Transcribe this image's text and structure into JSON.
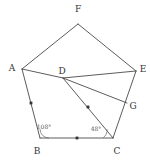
{
  "figure": {
    "type": "geometry-diagram",
    "background_color": "#ffffff",
    "line_color": "#4a4a4a",
    "label_color": "#333333",
    "canvas": {
      "width": 150,
      "height": 162
    }
  },
  "points": [
    {
      "id": "A",
      "label": "A",
      "x": 22,
      "y": 69,
      "label_x": 12,
      "label_y": 68
    },
    {
      "id": "B",
      "label": "B",
      "x": 40,
      "y": 138,
      "label_x": 37,
      "label_y": 151
    },
    {
      "id": "C",
      "label": "C",
      "x": 113,
      "y": 138,
      "label_x": 117,
      "label_y": 151
    },
    {
      "id": "D",
      "label": "D",
      "x": 63,
      "y": 78,
      "label_x": 62,
      "label_y": 71
    },
    {
      "id": "E",
      "label": "E",
      "x": 136,
      "y": 71,
      "label_x": 143,
      "label_y": 69
    },
    {
      "id": "F",
      "label": "F",
      "x": 78,
      "y": 24,
      "label_x": 78,
      "label_y": 9
    },
    {
      "id": "G",
      "label": "G",
      "x": 127,
      "y": 103,
      "label_x": 133,
      "label_y": 106
    }
  ],
  "segments": [
    {
      "id": "AF",
      "from": "A",
      "to": "F",
      "kind": "edge"
    },
    {
      "id": "FE",
      "from": "F",
      "to": "E",
      "kind": "edge"
    },
    {
      "id": "EC",
      "from": "E",
      "to": "C",
      "kind": "edge"
    },
    {
      "id": "CB",
      "from": "C",
      "to": "B",
      "kind": "edge"
    },
    {
      "id": "BA",
      "from": "B",
      "to": "A",
      "kind": "edge"
    },
    {
      "id": "AD",
      "from": "A",
      "to": "D",
      "kind": "chord"
    },
    {
      "id": "DE",
      "from": "D",
      "to": "E",
      "kind": "chord"
    },
    {
      "id": "DG",
      "from": "D",
      "to": "G",
      "kind": "chord"
    },
    {
      "id": "DC",
      "from": "D",
      "to": "C",
      "kind": "chord"
    }
  ],
  "tick_marks": [
    {
      "id": "tick-AB",
      "on": "BA",
      "x": 31,
      "y": 103
    },
    {
      "id": "tick-BC",
      "on": "CB",
      "x": 77,
      "y": 138
    },
    {
      "id": "tick-DC",
      "on": "DC",
      "x": 88,
      "y": 107
    }
  ],
  "angles": [
    {
      "id": "angle-B",
      "at": "B",
      "value": "108°",
      "label_x": 44,
      "label_y": 127,
      "arc": "M 40 129 A 9 9 0 0 0 49 138"
    },
    {
      "id": "angle-C",
      "at": "C",
      "value": "48°",
      "label_x": 96,
      "label_y": 129,
      "arc": "M 103 138 A 10 10 0 0 0 107 129"
    }
  ]
}
